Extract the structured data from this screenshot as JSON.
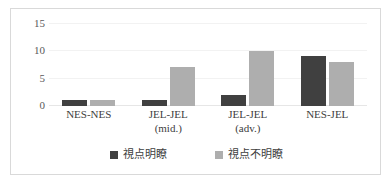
{
  "chart_data": {
    "type": "bar",
    "title": "",
    "subtitle": "",
    "xlabel": "",
    "ylabel": "",
    "ylim": [
      0,
      15
    ],
    "yticks": [
      0,
      5,
      10,
      15
    ],
    "grid": true,
    "legend_position": "bottom",
    "categories": [
      "NES-NES",
      "JEL-JEL\n(mid.)",
      "JEL-JEL\n(adv.)",
      "NES-JEL"
    ],
    "category_lines": [
      {
        "line1": "NES-NES",
        "line2": ""
      },
      {
        "line1": "JEL-JEL",
        "line2": "(mid.)"
      },
      {
        "line1": "JEL-JEL",
        "line2": "(adv.)"
      },
      {
        "line1": "NES-JEL",
        "line2": ""
      }
    ],
    "series": [
      {
        "name": "視点明瞭",
        "color": "#404040",
        "values": [
          1,
          1,
          2,
          9
        ]
      },
      {
        "name": "視点不明瞭",
        "color": "#aeaeae",
        "values": [
          1,
          7,
          10,
          8
        ]
      }
    ]
  },
  "axis": {
    "ytick_labels": [
      "15",
      "10",
      "5",
      "0"
    ]
  },
  "colors": {
    "series_a": "#404040",
    "series_b": "#aeaeae",
    "gridline": "#f2f2f2",
    "baseline": "#e6e6e6",
    "border": "#d9d9d9",
    "tick_text": "#595959",
    "label_text": "#404040"
  }
}
